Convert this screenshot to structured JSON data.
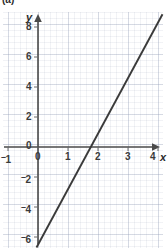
{
  "figure": {
    "part_label": "(a)"
  },
  "chart_data": {
    "type": "line",
    "title": "",
    "xlabel": "x",
    "ylabel": "y",
    "xlim": [
      -1.3,
      4.4
    ],
    "ylim": [
      -7.2,
      8.6
    ],
    "grid": true,
    "minor_grid": true,
    "grid_step_minor": 0.2,
    "grid_step_major": 1,
    "legend": "none",
    "x_ticks": [
      -1,
      0,
      1,
      2,
      3,
      4
    ],
    "x_tick_labels": [
      "⁻1",
      "0",
      "1",
      "2",
      "3",
      "4"
    ],
    "y_ticks": [
      -6,
      -4,
      -2,
      0,
      2,
      4,
      6,
      8
    ],
    "y_tick_labels": [
      "⁻6",
      "⁻4",
      "⁻2",
      "0",
      "2",
      "4",
      "6",
      "8"
    ],
    "series": [
      {
        "name": "line",
        "slope": 3.7,
        "intercept": -6.5,
        "x_intercept": 1.76,
        "points": [
          [
            -0.05,
            -6.7
          ],
          [
            4.15,
            8.85
          ]
        ]
      }
    ],
    "colors": {
      "line": "#3a3a3a",
      "axis": "#4a4a4a",
      "grid_major": "#96a0b9",
      "grid_minor": "#c9cfdd",
      "text": "#3a3a3a",
      "background": "#ffffff"
    }
  },
  "axis_labels": {
    "x": "x",
    "y": "y"
  }
}
